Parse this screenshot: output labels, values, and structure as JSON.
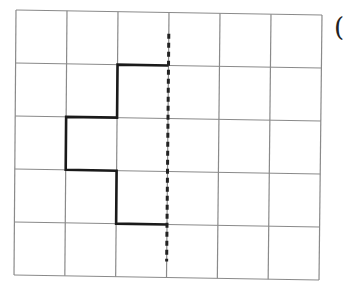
{
  "diagram": {
    "type": "grid-reflection",
    "grid": {
      "columns": 6,
      "rows": 5,
      "corners": {
        "top_left": [
          16,
          10
        ],
        "top_right": [
          322,
          15
        ],
        "bottom_right": [
          319,
          280
        ],
        "bottom_left": [
          14,
          275
        ]
      },
      "line_color": "#8a8a8a"
    },
    "mirror_line": {
      "style": "dashed",
      "column_index": 3,
      "from_row": 0.4,
      "to_row": 4.7,
      "color": "#222222"
    },
    "shape_path": {
      "style": "bold",
      "color": "#1a1a1a",
      "points_grid": [
        [
          3,
          1
        ],
        [
          2,
          1
        ],
        [
          2,
          2
        ],
        [
          1,
          2
        ],
        [
          1,
          3
        ],
        [
          2,
          3
        ],
        [
          2,
          4
        ],
        [
          3,
          4
        ]
      ]
    },
    "label": "("
  }
}
